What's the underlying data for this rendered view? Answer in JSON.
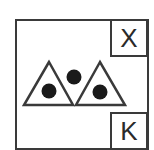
{
  "diagram": {
    "corner_labels": {
      "top_right": "X",
      "bottom_right": "K"
    },
    "symbol": {
      "description": "two outlined triangles side by side, each containing one filled dot, with a third filled dot between them above",
      "triangles": 2,
      "dots": 3
    },
    "colors": {
      "stroke": "#3a3a3a",
      "fill_dot": "#1a1a1a",
      "background": "#ffffff"
    }
  }
}
